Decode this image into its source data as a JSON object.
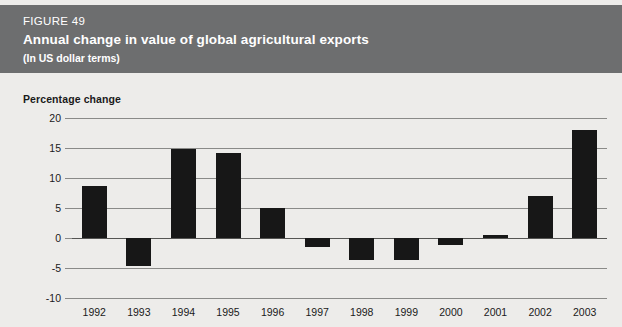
{
  "header": {
    "figure_number": "FIGURE 49",
    "title": "Annual change in value of global agricultural exports",
    "subtitle": "(In US dollar terms)",
    "band_color": "#6d6e6f",
    "text_color": "#ffffff"
  },
  "page": {
    "background_color": "#edecea",
    "bar_color": "#171717",
    "gridline_color": "#8a8a88"
  },
  "chart_data": {
    "type": "bar",
    "title": "Annual change in value of global agricultural exports",
    "subtitle": "(In US dollar terms)",
    "xlabel": "",
    "ylabel": "Percentage change",
    "categories": [
      "1992",
      "1993",
      "1994",
      "1995",
      "1996",
      "1997",
      "1998",
      "1999",
      "2000",
      "2001",
      "2002",
      "2003"
    ],
    "values": [
      8.7,
      -4.6,
      14.9,
      14.2,
      5.0,
      -1.5,
      -3.7,
      -3.7,
      -1.2,
      0.5,
      7.0,
      18.0
    ],
    "ylim": [
      -10,
      20
    ],
    "yticks": [
      20,
      15,
      10,
      5,
      0,
      -5,
      -10
    ],
    "ytick_labels": [
      "20",
      "15",
      "10",
      "5",
      "0",
      "-5",
      "-10"
    ],
    "grid": true,
    "legend": null,
    "series_color": "#171717"
  }
}
